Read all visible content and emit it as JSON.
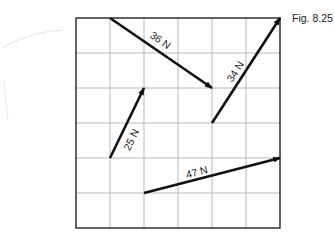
{
  "figure": {
    "caption": "Fig. 8.25",
    "grid": {
      "columns": 6,
      "rows": 6,
      "origin_px": [
        76,
        18
      ],
      "cell_w_px": 34,
      "cell_h_px": 35,
      "line_color": "#b9b9b9",
      "border_color": "#222222"
    },
    "vectors": [
      {
        "label": "36 N",
        "from_cell": [
          1,
          0
        ],
        "to_cell": [
          4,
          2
        ],
        "label_pos": [
          160,
          41
        ],
        "label_rot": 34
      },
      {
        "label": "34 N",
        "from_cell": [
          4,
          3
        ],
        "to_cell": [
          6,
          0
        ],
        "label_pos": [
          236,
          72
        ],
        "label_rot": -57
      },
      {
        "label": "25 N",
        "from_cell": [
          1,
          4
        ],
        "to_cell": [
          2,
          2
        ],
        "label_pos": [
          132,
          140
        ],
        "label_rot": -64
      },
      {
        "label": "47 N",
        "from_cell": [
          2,
          5
        ],
        "to_cell": [
          6,
          4
        ],
        "label_pos": [
          197,
          173
        ],
        "label_rot": -15
      }
    ],
    "arrow_color": "#111111"
  }
}
